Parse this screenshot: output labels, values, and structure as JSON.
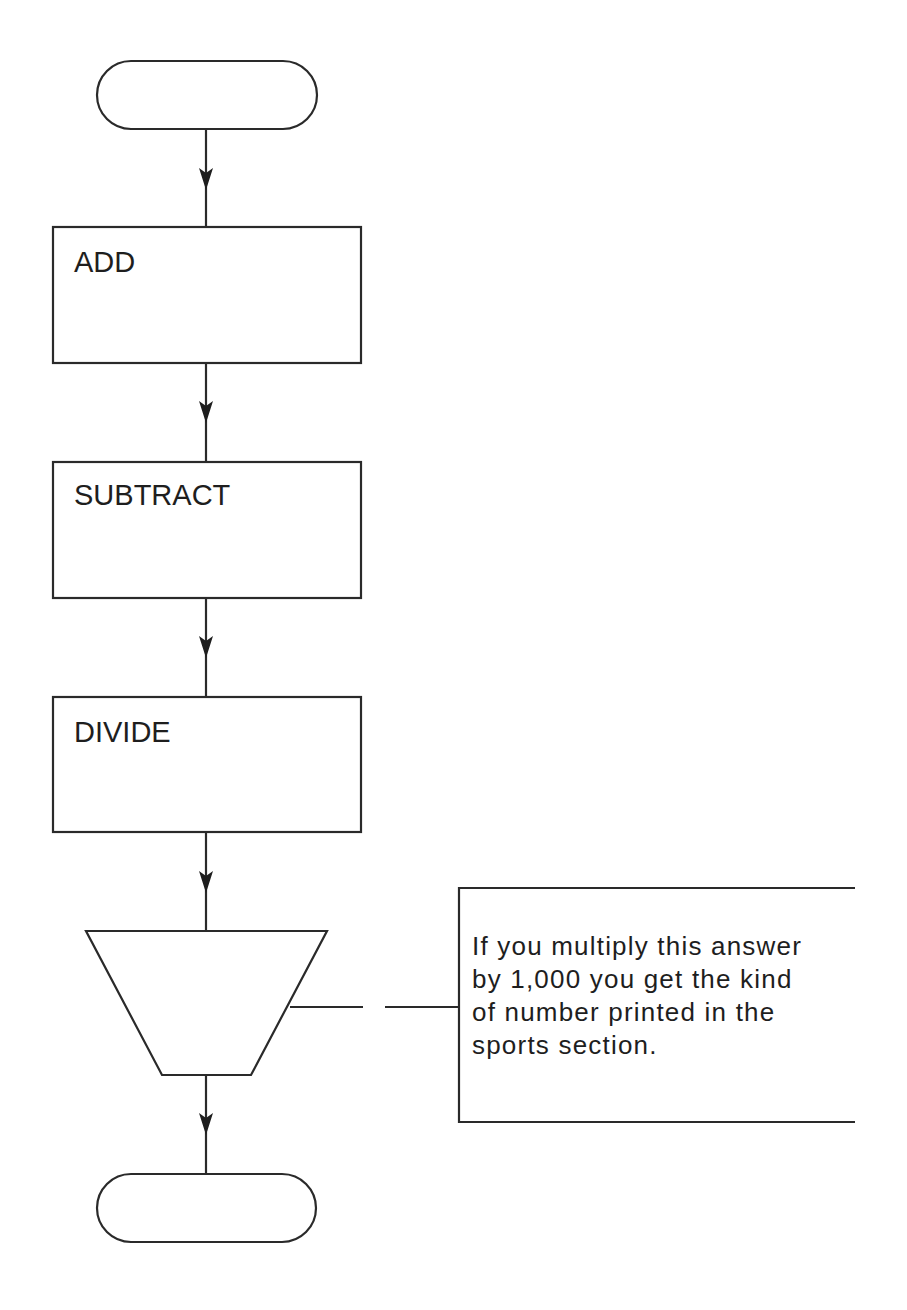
{
  "flowchart": {
    "start_terminator": {
      "label": ""
    },
    "steps": [
      {
        "id": "add",
        "label": "ADD"
      },
      {
        "id": "subtract",
        "label": "SUBTRACT"
      },
      {
        "id": "divide",
        "label": "DIVIDE"
      }
    ],
    "output_step": {
      "shape": "manual-operation-trapezoid",
      "label": ""
    },
    "end_terminator": {
      "label": ""
    },
    "annotation": {
      "lines": [
        "If you multiply this answer",
        "by 1,000 you get the kind",
        "of number printed in the",
        "sports section."
      ]
    },
    "colors": {
      "stroke": "#2a2a2a",
      "text": "#1e1e1e",
      "background": "#ffffff"
    }
  }
}
